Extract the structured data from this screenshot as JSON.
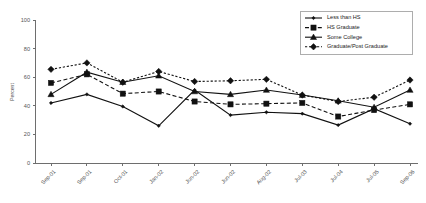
{
  "chart_data": {
    "type": "line",
    "title": "",
    "xlabel": "",
    "ylabel": "Percent",
    "ylim": [
      0,
      100
    ],
    "yticks": [
      0,
      20,
      40,
      60,
      80,
      100
    ],
    "grid": false,
    "legend_position": "top-right",
    "categories": [
      "Sep-01",
      "Sep-01",
      "Oct-01",
      "Jan-02",
      "Jun-02",
      "Jun-02",
      "Aug-02",
      "Jul-03",
      "Jul-04",
      "Jul-05",
      "Sep-06"
    ],
    "series": [
      {
        "name": "Less than HS",
        "marker": "diamond-small",
        "line_style": "solid",
        "values": [
          42,
          48,
          39.5,
          26,
          51,
          33.5,
          35.5,
          34.5,
          26.5,
          38,
          27.5
        ]
      },
      {
        "name": "HS Graduate",
        "marker": "square",
        "line_style": "dashed",
        "values": [
          56,
          62,
          48.5,
          50,
          43,
          41,
          41.5,
          42,
          32.5,
          37,
          41
        ]
      },
      {
        "name": "Some College",
        "marker": "triangle",
        "line_style": "solid",
        "values": [
          48,
          63.5,
          56.5,
          61,
          50,
          48,
          51,
          47.5,
          43.5,
          39,
          51
        ]
      },
      {
        "name": "Graduate/Post Graduate",
        "marker": "diamond",
        "line_style": "dotted",
        "values": [
          65.5,
          70,
          56.5,
          64,
          57,
          57.5,
          58.5,
          47.5,
          43,
          46,
          58
        ]
      }
    ]
  },
  "colors": {
    "series": "#111111",
    "axis": "#6e6e6e",
    "text": "#555555",
    "background": "#ffffff"
  }
}
